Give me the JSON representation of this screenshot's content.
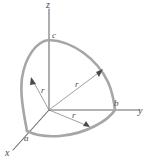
{
  "figure": {
    "background_color": "#ffffff",
    "axis_color": "#6b6b6b",
    "arc_color": "#a6a6a6",
    "radius_color": "#8f8f8f",
    "label_color": "#4d4d4d",
    "axes": [
      {
        "key": "z",
        "label": "z",
        "name": "z-axis",
        "direction": "up"
      },
      {
        "key": "y",
        "label": "y",
        "name": "y-axis",
        "direction": "right"
      },
      {
        "key": "x",
        "label": "x",
        "name": "x-axis",
        "direction": "down-left"
      }
    ],
    "intercepts": [
      {
        "key": "c",
        "label": "c",
        "axis": "z",
        "name": "z-intercept"
      },
      {
        "key": "b",
        "label": "b",
        "axis": "y",
        "name": "y-intercept"
      },
      {
        "key": "a",
        "label": "a",
        "axis": "x",
        "name": "x-intercept"
      }
    ],
    "radii": [
      {
        "key": "r_upper_left",
        "label": "r",
        "name": "radius-to-xz-arc"
      },
      {
        "key": "r_upper_right",
        "label": "r",
        "name": "radius-to-yz-arc"
      },
      {
        "key": "r_lower",
        "label": "r",
        "name": "radius-to-xy-arc"
      }
    ],
    "arcs": [
      {
        "key": "arc_ca",
        "name": "arc-c-to-a",
        "from": "c",
        "to": "a"
      },
      {
        "key": "arc_cb",
        "name": "arc-c-to-b",
        "from": "c",
        "to": "b"
      },
      {
        "key": "arc_ab",
        "name": "arc-a-to-b",
        "from": "a",
        "to": "b"
      }
    ]
  }
}
